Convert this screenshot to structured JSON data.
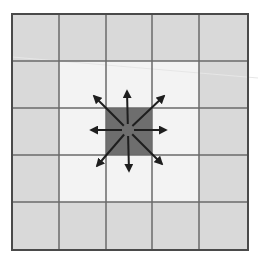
{
  "diagram": {
    "type": "grid-neighborhood",
    "grid": {
      "rows": 5,
      "cols": 5,
      "x_lines": [
        12,
        59,
        106,
        152,
        199,
        248
      ],
      "y_lines": [
        14,
        61,
        108,
        155,
        202,
        250
      ]
    },
    "cell_states": [
      [
        "outer",
        "outer",
        "outer",
        "outer",
        "outer"
      ],
      [
        "outer",
        "neighbor",
        "neighbor",
        "neighbor",
        "outer"
      ],
      [
        "outer",
        "neighbor",
        "center",
        "neighbor",
        "outer"
      ],
      [
        "outer",
        "neighbor",
        "neighbor",
        "neighbor",
        "outer"
      ],
      [
        "outer",
        "outer",
        "outer",
        "outer",
        "outer"
      ]
    ],
    "colors": {
      "outer": "#d9d9d9",
      "neighbor": "#f3f3f3",
      "center": "#6e6e6e",
      "grid_line": "#6a6a6a",
      "border": "#4a4a4a",
      "arrow": "#1e1e1e"
    },
    "arrows": {
      "origin": [
        128,
        130
      ],
      "directions": [
        {
          "name": "up",
          "to": [
            127,
            91
          ]
        },
        {
          "name": "up-right",
          "to": [
            164,
            96
          ]
        },
        {
          "name": "right",
          "to": [
            166,
            130
          ]
        },
        {
          "name": "down-right",
          "to": [
            162,
            164
          ]
        },
        {
          "name": "down",
          "to": [
            129,
            171
          ]
        },
        {
          "name": "down-left",
          "to": [
            97,
            166
          ]
        },
        {
          "name": "left",
          "to": [
            91,
            130
          ]
        },
        {
          "name": "up-left",
          "to": [
            94,
            96
          ]
        }
      ],
      "start_offset": 6
    }
  }
}
